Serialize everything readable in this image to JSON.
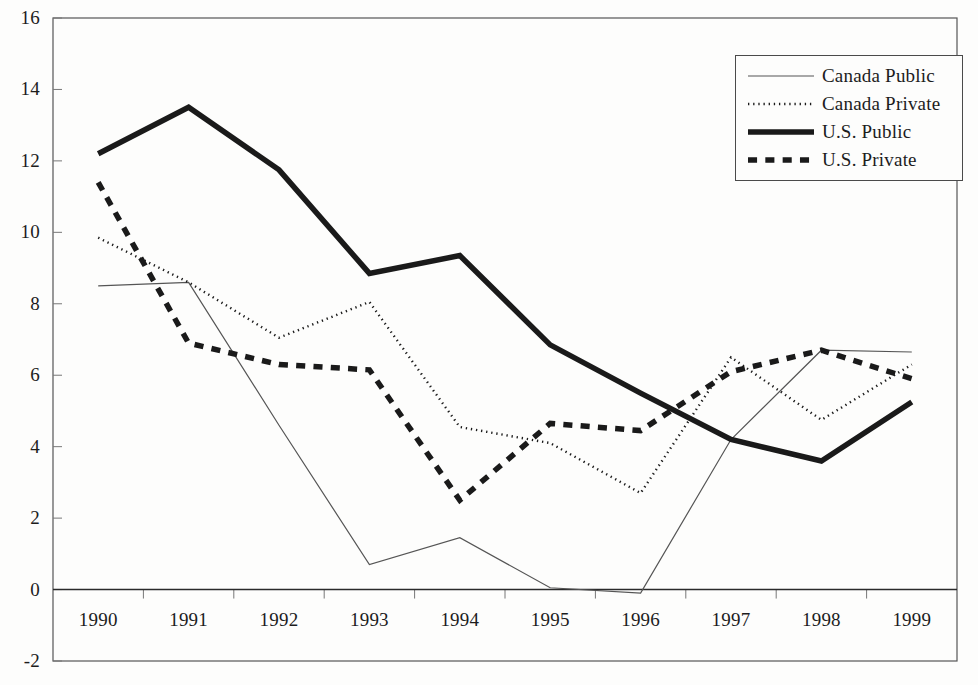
{
  "chart_data": {
    "type": "line",
    "title": "",
    "subtitle": "",
    "xlabel": "",
    "ylabel": "",
    "categories": [
      "1990",
      "1991",
      "1992",
      "1993",
      "1994",
      "1995",
      "1996",
      "1997",
      "1998",
      "1999"
    ],
    "x": [
      1990,
      1991,
      1992,
      1993,
      1994,
      1995,
      1996,
      1997,
      1998,
      1999
    ],
    "ylim": [
      -2,
      16
    ],
    "yticks": [
      -2,
      0,
      2,
      4,
      6,
      8,
      10,
      12,
      14,
      16
    ],
    "ytick_labels": [
      "-2",
      "0",
      "2",
      "4",
      "6",
      "8",
      "10",
      "12",
      "14",
      "16"
    ],
    "grid": false,
    "legend_position": "top-right",
    "series": [
      {
        "name": "Canada Public",
        "style": "thin-solid",
        "color": "#555555",
        "width": 1.2,
        "values": [
          8.5,
          8.6,
          4.6,
          0.7,
          1.45,
          0.05,
          -0.1,
          4.2,
          6.7,
          6.65
        ]
      },
      {
        "name": "Canada Private",
        "style": "dotted",
        "color": "#1a1a1a",
        "width": 2.4,
        "values": [
          9.85,
          8.6,
          7.05,
          8.05,
          4.55,
          4.1,
          2.7,
          6.5,
          4.75,
          6.3
        ]
      },
      {
        "name": "U.S. Public",
        "style": "thick-solid",
        "color": "#1a1a1a",
        "width": 5.5,
        "values": [
          12.2,
          13.5,
          11.75,
          8.85,
          9.35,
          6.85,
          5.5,
          4.2,
          3.6,
          5.25
        ]
      },
      {
        "name": "U.S. Private",
        "style": "thick-dashed",
        "color": "#1a1a1a",
        "width": 5.5,
        "values": [
          11.4,
          6.9,
          6.3,
          6.15,
          2.5,
          4.65,
          4.45,
          6.1,
          6.7,
          5.9
        ]
      }
    ]
  },
  "legend": {
    "items": [
      {
        "label": "Canada Public",
        "style": "thin-solid"
      },
      {
        "label": "Canada Private",
        "style": "dotted"
      },
      {
        "label": "U.S. Public",
        "style": "thick-solid"
      },
      {
        "label": "U.S. Private",
        "style": "thick-dashed"
      }
    ]
  },
  "axes": {
    "zero_line_visible": true,
    "frame_visible": true
  }
}
